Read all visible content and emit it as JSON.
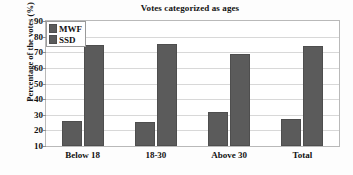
{
  "chart_data": {
    "type": "bar",
    "title": "Votes categorized as ages",
    "xlabel": "",
    "ylabel": "Percentage of the votes (%)",
    "categories": [
      "Below 18",
      "18-30",
      "Above 30",
      "Total"
    ],
    "series": [
      {
        "name": "MWF",
        "values": [
          26,
          25.5,
          32,
          27.5
        ],
        "color": "#5b5b5b"
      },
      {
        "name": "SSD",
        "values": [
          74.5,
          75.5,
          69,
          74
        ],
        "color": "#5b5b5b"
      }
    ],
    "ylim": [
      10,
      90
    ],
    "yticks": [
      10,
      20,
      30,
      40,
      50,
      60,
      70,
      80,
      90
    ],
    "ytick_labels": [
      "10",
      "20",
      "30",
      "40",
      "50",
      "60",
      "70",
      "80",
      "90"
    ],
    "grid": true,
    "legend_position": "top-left",
    "legend_entries": [
      "MWF",
      "SSD"
    ]
  }
}
